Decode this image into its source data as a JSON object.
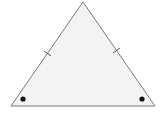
{
  "diagram": {
    "type": "isosceles-triangle",
    "colors": {
      "background": "#ffffff",
      "fill": "#f3f3f3",
      "stroke": "#7a7a7a",
      "dot": "#111111"
    },
    "vertices": {
      "apex": [
        83,
        2
      ],
      "base_left": [
        11,
        106
      ],
      "base_right": [
        155,
        106
      ]
    },
    "tick_marks": [
      {
        "side": "left",
        "count": 1
      },
      {
        "side": "right",
        "count": 1
      }
    ],
    "angle_marks": [
      {
        "vertex": "base_left",
        "style": "dot"
      },
      {
        "vertex": "base_right",
        "style": "dot"
      }
    ]
  }
}
